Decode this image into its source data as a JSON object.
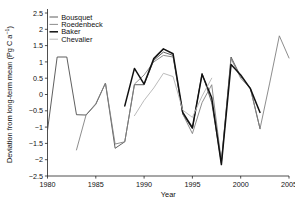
{
  "chart_data": {
    "type": "line",
    "title": "",
    "xlabel": "Year",
    "ylabel": "Deviation from long-term mean (Pg C a⁻¹)",
    "ylabel_main": "Deviation from long-term mean (Pg C a",
    "ylabel_sup": "−1",
    "ylabel_tail": ")",
    "xlim": [
      1980,
      2005
    ],
    "ylim": [
      -2.5,
      2.5
    ],
    "grid": false,
    "legend_position": "top-left",
    "xticks": [
      1980,
      1985,
      1990,
      1995,
      2000,
      2005
    ],
    "xtick_labels": [
      "1980",
      "1985",
      "1990",
      "1995",
      "2000",
      "2005"
    ],
    "yticks": [
      -2.5,
      -2,
      -1.5,
      -1,
      -0.5,
      0,
      0.5,
      1,
      1.5,
      2,
      2.5
    ],
    "ytick_labels": [
      "−2.5",
      "−2",
      "−1.5",
      "−1",
      "−0.5",
      "0",
      "0.5",
      "1",
      "1.5",
      "2",
      "2.5"
    ],
    "series": [
      {
        "name": "Bousquet",
        "color": "#4d4d4d",
        "width": 0.9,
        "x": [
          1980,
          1981,
          1982,
          1983,
          1984,
          1985,
          1986,
          1987,
          1988,
          1989,
          1990,
          1991,
          1992,
          1993,
          1994,
          1995,
          1996,
          1997,
          1998,
          1999,
          2000,
          2001,
          2002
        ],
        "values": [
          -1.1,
          1.15,
          1.15,
          -0.62,
          -0.63,
          -0.3,
          0.35,
          -1.65,
          -1.45,
          0.3,
          0.3,
          1.05,
          1.3,
          1.2,
          -0.6,
          -1.05,
          0.65,
          -0.25,
          -2.1,
          1.15,
          0.55,
          0.2,
          -1.05
        ]
      },
      {
        "name": "Roedenbeck",
        "color": "#808080",
        "width": 0.9,
        "x": [
          1983,
          1984,
          1985,
          1986,
          1987,
          1988,
          1989,
          1990,
          1991,
          1992,
          1993,
          1994,
          1995,
          1996,
          1997,
          1998,
          1999,
          2000,
          2001,
          2002,
          2003,
          2004,
          2005
        ],
        "values": [
          -1.7,
          -0.62,
          -0.28,
          0.35,
          -1.52,
          -1.45,
          0.32,
          0.6,
          1.0,
          1.2,
          1.15,
          -0.6,
          -1.2,
          -0.25,
          0.3,
          -2.05,
          1.1,
          0.5,
          0.18,
          -1.05,
          0.35,
          1.8,
          1.12
        ]
      },
      {
        "name": "Baker",
        "color": "#111111",
        "width": 1.5,
        "x": [
          1988,
          1989,
          1990,
          1991,
          1992,
          1993,
          1994,
          1995,
          1996,
          1997,
          1998,
          1999,
          2000,
          2001,
          2002
        ],
        "values": [
          -0.35,
          0.8,
          0.32,
          1.1,
          1.4,
          1.25,
          -0.55,
          -1.02,
          0.62,
          -0.1,
          -2.15,
          0.92,
          0.6,
          0.18,
          -0.55
        ]
      },
      {
        "name": "Chevalier",
        "color": "#b3b3b3",
        "width": 0.9,
        "x": [
          1989,
          1990,
          1991,
          1992,
          1993,
          1994,
          1995,
          1996,
          1997
        ],
        "values": [
          -0.65,
          -0.18,
          0.2,
          0.65,
          0.55,
          -0.48,
          -0.7,
          -0.05,
          0.5
        ]
      }
    ]
  },
  "legend": {
    "items": [
      {
        "label": "Bousquet"
      },
      {
        "label": "Roedenbeck"
      },
      {
        "label": "Baker"
      },
      {
        "label": "Chevalier"
      }
    ]
  }
}
